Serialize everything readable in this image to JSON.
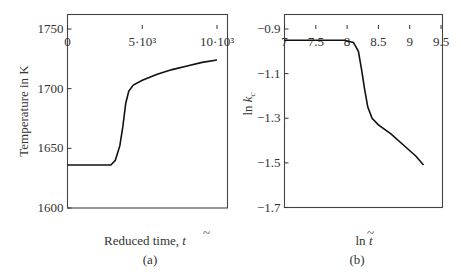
{
  "chart_data": [
    {
      "type": "line",
      "panel_label": "(a)",
      "xlabel": "Reduced time, t̃",
      "ylabel": "Temperature in K",
      "xlim": [
        0,
        10500
      ],
      "ylim": [
        1600,
        1760
      ],
      "x_ticks": [
        0,
        5000,
        10000
      ],
      "x_tick_labels": [
        "0",
        "5·10³",
        "10·10³"
      ],
      "y_ticks": [
        1600,
        1650,
        1700,
        1750
      ],
      "y_tick_labels": [
        "1600",
        "1650",
        "1700",
        "1750"
      ],
      "grid": false,
      "series": [
        {
          "name": "Temperature",
          "x": [
            0,
            1000,
            2000,
            2900,
            3200,
            3500,
            3700,
            3900,
            4100,
            4400,
            5000,
            6000,
            7000,
            8000,
            9000,
            10000
          ],
          "y": [
            1636,
            1636,
            1636,
            1636,
            1640,
            1652,
            1668,
            1688,
            1698,
            1703,
            1707,
            1712,
            1716,
            1719,
            1722,
            1724
          ]
        }
      ]
    },
    {
      "type": "line",
      "panel_label": "(b)",
      "xlabel": "ln t̃",
      "ylabel": "ln k̃c",
      "xlim": [
        7,
        9.6
      ],
      "ylim": [
        -1.7,
        -0.84
      ],
      "x_ticks": [
        7,
        7.5,
        8,
        8.5,
        9,
        9.5
      ],
      "x_tick_labels": [
        "7",
        "7.5",
        "8",
        "8.5",
        "9",
        "9.5"
      ],
      "y_ticks": [
        -1.7,
        -1.5,
        -1.3,
        -1.1,
        -0.9
      ],
      "y_tick_labels": [
        "−1.7",
        "−1.5",
        "−1.3",
        "−1.1",
        "−0.9"
      ],
      "grid": false,
      "series": [
        {
          "name": "ln kc",
          "x": [
            7.0,
            7.5,
            7.95,
            8.1,
            8.18,
            8.23,
            8.28,
            8.33,
            8.4,
            8.5,
            8.7,
            8.9,
            9.1,
            9.22
          ],
          "y": [
            -0.95,
            -0.95,
            -0.95,
            -0.96,
            -1.0,
            -1.08,
            -1.17,
            -1.25,
            -1.3,
            -1.33,
            -1.37,
            -1.42,
            -1.47,
            -1.51
          ]
        }
      ]
    }
  ],
  "panels": {
    "a": {
      "label": "(a)",
      "xlabel": "Reduced time, ",
      "xvar": "t",
      "ylabel": "Temperature in K"
    },
    "b": {
      "label": "(b)",
      "xlabel": "ln ",
      "xvar": "t",
      "ylabel_pre": "ln ",
      "ylabel_var": "k",
      "ylabel_sub": "c"
    }
  }
}
